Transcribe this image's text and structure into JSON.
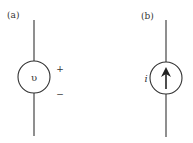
{
  "panels": {
    "a": {
      "label": "(a)",
      "symbol": "υ",
      "plus": "+",
      "minus": "−",
      "type": "voltage-source"
    },
    "b": {
      "label": "(b)",
      "symbol": "i",
      "type": "current-source",
      "arrow_direction": "up"
    }
  },
  "colors": {
    "stroke": "#333333",
    "background": "#ffffff"
  }
}
